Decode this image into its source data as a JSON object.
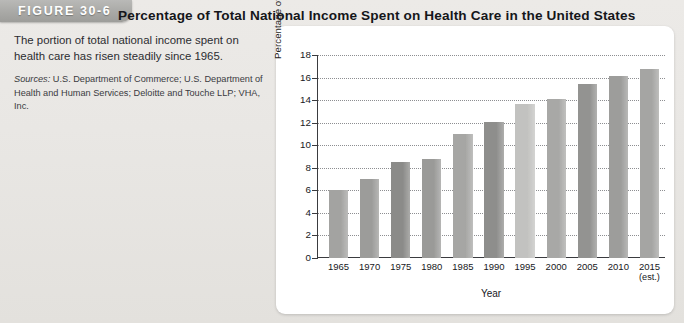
{
  "figure": {
    "tab_label": "FIGURE 30-6"
  },
  "caption": {
    "description": "The portion of total national income spent on health care has risen steadily since 1965.",
    "sources_label": "Sources:",
    "sources_text": " U.S. Department of Commerce; U.S. Department of Health and Human Services; Deloitte and Touche LLP; VHA, Inc."
  },
  "chart_data": {
    "type": "bar",
    "title": "Percentage of Total National Income Spent on Health Care in the United States",
    "xlabel": "Year",
    "ylabel": "Percentage of Total National Income",
    "categories": [
      "1965",
      "1970",
      "1975",
      "1980",
      "1985",
      "1990",
      "1995",
      "2000",
      "2005",
      "2010",
      "2015"
    ],
    "category_sublabels": [
      "",
      "",
      "",
      "",
      "",
      "",
      "",
      "",
      "",
      "",
      "(est.)"
    ],
    "values": [
      6.0,
      7.0,
      8.5,
      8.8,
      11.0,
      12.1,
      13.7,
      14.1,
      15.4,
      16.1,
      16.8
    ],
    "bar_colors": [
      "#a3a3a1",
      "#9c9c9a",
      "#8b8b89",
      "#9a9a98",
      "#a6a6a4",
      "#8e8e8c",
      "#c2c2c0",
      "#a8a8a6",
      "#939391",
      "#9d9d9b",
      "#a5a5a3"
    ],
    "ylim": [
      0,
      18
    ],
    "yticks": [
      0,
      2,
      4,
      6,
      8,
      10,
      12,
      14,
      16,
      18
    ],
    "ytick_labels": [
      "0",
      "2",
      "4",
      "6",
      "8",
      "10",
      "12",
      "14",
      "16",
      "18"
    ],
    "grid": true,
    "grid_style": "dotted",
    "legend": null,
    "panel_background": "#ffffff",
    "page_background": "#e8e7e4"
  }
}
